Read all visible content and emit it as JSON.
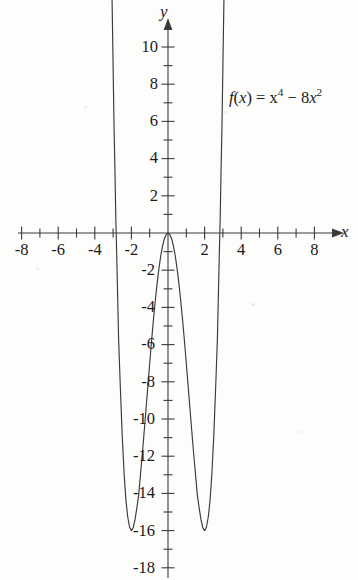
{
  "figure": {
    "background_color": "#fdfdfc",
    "ink_color": "#3a3a3a",
    "text_color": "#1a1a1a"
  },
  "axes": {
    "x_axis_name": "x",
    "y_axis_name": "y",
    "origin_px": {
      "x": 168,
      "y": 233
    },
    "px_per_x_unit": 18.3,
    "px_per_y_unit": 18.6,
    "x_tick_labels": [
      "-8",
      "-6",
      "-4",
      "-2",
      "2",
      "4",
      "6",
      "8"
    ],
    "y_tick_labels": [
      "10",
      "8",
      "6",
      "4",
      "2",
      "-2",
      "-4",
      "-6",
      "-8",
      "-10",
      "-12",
      "-14",
      "-16",
      "-18"
    ]
  },
  "function_label": {
    "full_text": "f(x) = x4 - 8x2",
    "fn_name": "f",
    "open_paren": "(",
    "variable": "x",
    "close_paren": ")",
    "equals": " = ",
    "term1_base": "x",
    "term1_exponent": "4",
    "operator": " - ",
    "term2_coefficient": "8",
    "term2_base": "x",
    "term2_exponent": "2"
  },
  "chart_data": {
    "type": "line",
    "title": "",
    "subtitle": "",
    "xlabel": "x",
    "ylabel": "y",
    "expression": "f(x) = x^4 - 8x^2",
    "xlim": [
      -9.0,
      9.0
    ],
    "ylim": [
      -18.6,
      11.7
    ],
    "grid": false,
    "legend": false,
    "annotations": [
      "f(x) = x⁴ − 8x²"
    ],
    "x_ticks": [
      -8,
      -7,
      -6,
      -5,
      -4,
      -3,
      -2,
      -1,
      1,
      2,
      3,
      4,
      5,
      6,
      7,
      8
    ],
    "x_ticks_labeled": [
      -8,
      -6,
      -4,
      -2,
      2,
      4,
      6,
      8
    ],
    "y_ticks": [
      10,
      9,
      8,
      7,
      6,
      5,
      4,
      3,
      2,
      1,
      -1,
      -2,
      -3,
      -4,
      -5,
      -6,
      -7,
      -8,
      -9,
      -10,
      -11,
      -12,
      -13,
      -14,
      -15,
      -16,
      -17,
      -18
    ],
    "y_ticks_labeled": [
      10,
      8,
      6,
      4,
      2,
      -2,
      -4,
      -6,
      -8,
      -10,
      -12,
      -14,
      -16,
      -18
    ],
    "x_intercepts": [
      -2.828,
      0,
      2.828
    ],
    "local_maximum": {
      "x": 0,
      "y": 0
    },
    "local_minima": [
      {
        "x": -2,
        "y": -16
      },
      {
        "x": 2,
        "y": -16
      }
    ],
    "series": [
      {
        "name": "f(x) = x^4 - 8x^2",
        "color": "#3a3a3a",
        "x": [
          -3.22,
          -3.15,
          -3.1,
          -3.05,
          -3.0,
          -2.95,
          -2.9,
          -2.85,
          -2.8,
          -2.7,
          -2.6,
          -2.5,
          -2.4,
          -2.3,
          -2.2,
          -2.1,
          -2.0,
          -1.9,
          -1.8,
          -1.7,
          -1.6,
          -1.5,
          -1.4,
          -1.3,
          -1.2,
          -1.1,
          -1.0,
          -0.9,
          -0.8,
          -0.7,
          -0.6,
          -0.5,
          -0.4,
          -0.3,
          -0.2,
          -0.1,
          0.0,
          0.1,
          0.2,
          0.3,
          0.4,
          0.5,
          0.6,
          0.7,
          0.8,
          0.9,
          1.0,
          1.1,
          1.2,
          1.3,
          1.4,
          1.5,
          1.6,
          1.7,
          1.8,
          1.9,
          2.0,
          2.1,
          2.2,
          2.3,
          2.4,
          2.5,
          2.6,
          2.7,
          2.8,
          2.85,
          2.9,
          2.95,
          3.0,
          3.05,
          3.1,
          3.15,
          3.22
        ],
        "y": [
          24.63,
          19.05,
          15.56,
          12.12,
          9.0,
          5.79,
          3.41,
          0.7,
          -1.27,
          -5.68,
          -8.42,
          -10.94,
          -12.9,
          -14.36,
          -15.27,
          -15.82,
          -16.0,
          -15.84,
          -15.4,
          -14.76,
          -14.05,
          -12.94,
          -11.84,
          -10.66,
          -9.45,
          -8.22,
          -7.0,
          -5.82,
          -4.71,
          -3.68,
          -2.75,
          -1.94,
          -1.25,
          -0.71,
          -0.32,
          -0.08,
          0.0,
          -0.08,
          -0.32,
          -0.71,
          -1.25,
          -1.94,
          -2.75,
          -3.68,
          -4.71,
          -5.82,
          -7.0,
          -8.22,
          -9.45,
          -10.66,
          -11.84,
          -12.94,
          -14.05,
          -14.76,
          -15.4,
          -15.84,
          -16.0,
          -15.82,
          -15.27,
          -14.36,
          -12.9,
          -10.94,
          -8.42,
          -5.68,
          -1.27,
          0.7,
          3.41,
          5.79,
          9.0,
          12.12,
          15.56,
          19.05,
          24.63
        ]
      }
    ]
  }
}
